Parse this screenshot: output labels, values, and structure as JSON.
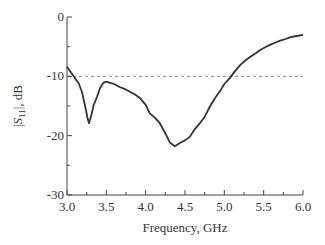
{
  "chart_data": {
    "type": "line",
    "title": "",
    "xlabel": "Frequency, GHz",
    "ylabel": "|S11|, dB",
    "ylabel_parts": {
      "pre": "|",
      "var": "S",
      "sub": "11",
      "post": "|, dB"
    },
    "xlim": [
      3.0,
      6.0
    ],
    "ylim": [
      -30,
      0
    ],
    "xticks": [
      "3.0",
      "3.5",
      "4.0",
      "4.5",
      "5.0",
      "5.5",
      "6.0"
    ],
    "yticks": [
      "0",
      "-10",
      "-20",
      "-30"
    ],
    "grid": false,
    "legend": null,
    "reference_line": {
      "y": -10,
      "style": "dashed",
      "color": "#888888"
    },
    "series": [
      {
        "name": "|S11|",
        "color": "#333333",
        "x": [
          3.0,
          3.05,
          3.1,
          3.15,
          3.19,
          3.23,
          3.26,
          3.28,
          3.31,
          3.34,
          3.38,
          3.42,
          3.46,
          3.5,
          3.55,
          3.6,
          3.67,
          3.73,
          3.8,
          3.87,
          3.93,
          4.0,
          4.05,
          4.12,
          4.18,
          4.25,
          4.31,
          4.37,
          4.44,
          4.5,
          4.56,
          4.62,
          4.69,
          4.75,
          4.82,
          4.88,
          4.95,
          5.0,
          5.07,
          5.13,
          5.2,
          5.27,
          5.33,
          5.4,
          5.45,
          5.52,
          5.58,
          5.65,
          5.71,
          5.78,
          5.84,
          5.92,
          6.0
        ],
        "y": [
          -8.4,
          -9.3,
          -10.3,
          -11.2,
          -12.6,
          -15.0,
          -17.0,
          -17.9,
          -16.5,
          -14.8,
          -13.5,
          -12.0,
          -11.1,
          -10.9,
          -11.1,
          -11.3,
          -11.8,
          -12.1,
          -12.6,
          -13.1,
          -13.7,
          -14.8,
          -16.2,
          -17.0,
          -17.9,
          -19.6,
          -21.2,
          -21.8,
          -21.2,
          -20.8,
          -20.2,
          -19.0,
          -17.9,
          -16.8,
          -15.0,
          -13.7,
          -12.4,
          -11.3,
          -10.3,
          -9.2,
          -8.1,
          -7.3,
          -6.7,
          -6.1,
          -5.6,
          -5.1,
          -4.7,
          -4.3,
          -4.0,
          -3.7,
          -3.4,
          -3.2,
          -3.0
        ]
      }
    ]
  }
}
